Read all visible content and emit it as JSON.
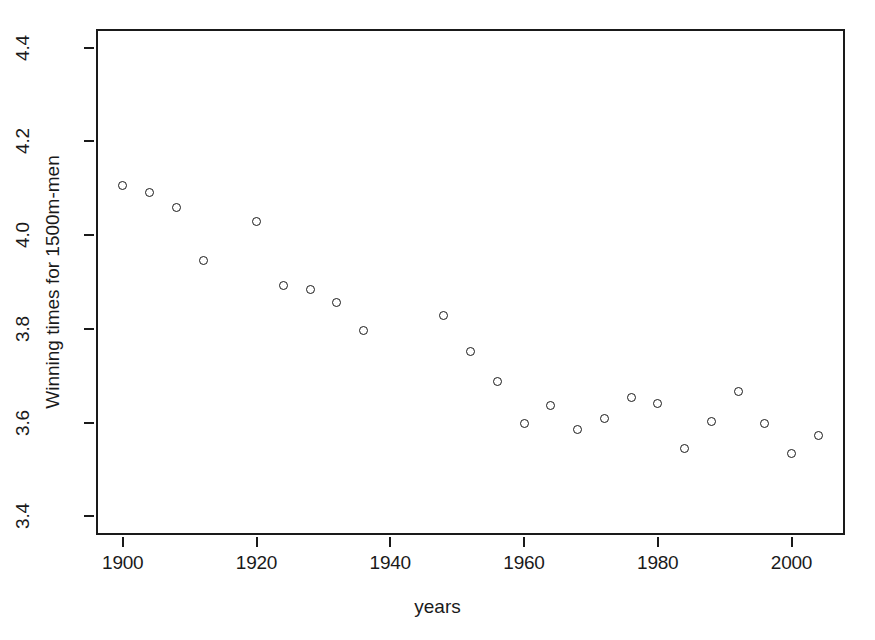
{
  "chart_data": {
    "type": "scatter",
    "title": "",
    "xlabel": "years",
    "ylabel": "Winning times for 1500m-men",
    "xlim": [
      1896.0,
      2008.0
    ],
    "ylim": [
      3.36,
      4.44
    ],
    "xticks": [
      1900,
      1920,
      1940,
      1960,
      1980,
      2000
    ],
    "xtick_labels": [
      "1900",
      "1920",
      "1940",
      "1960",
      "1980",
      "2000"
    ],
    "yticks": [
      3.4,
      3.6,
      3.8,
      4.0,
      4.2,
      4.4
    ],
    "ytick_labels": [
      "3.4",
      "3.6",
      "3.8",
      "4.0",
      "4.2",
      "4.4"
    ],
    "grid": false,
    "legend": null,
    "marker": "open-circle",
    "marker_color": "#1a1a1a",
    "x": [
      1900,
      1904,
      1908,
      1912,
      1920,
      1924,
      1928,
      1932,
      1936,
      1948,
      1952,
      1956,
      1960,
      1964,
      1968,
      1972,
      1976,
      1980,
      1984,
      1988,
      1992,
      1996,
      2000,
      2004
    ],
    "y": [
      4.105,
      4.09,
      4.06,
      3.945,
      4.03,
      3.893,
      3.885,
      3.857,
      3.797,
      3.828,
      3.752,
      3.688,
      3.598,
      3.637,
      3.586,
      3.608,
      3.654,
      3.64,
      3.545,
      3.603,
      3.667,
      3.598,
      3.533,
      3.572
    ]
  }
}
